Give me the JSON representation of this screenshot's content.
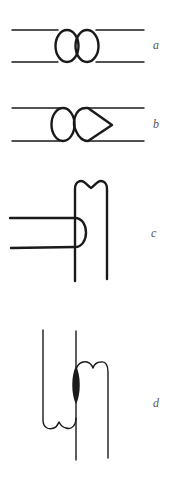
{
  "figures": [
    {
      "id": "a",
      "label": "a",
      "description": "two parallel horizontal lines joined by two adjacent ellipse loops"
    },
    {
      "id": "b",
      "label": "b",
      "description": "two parallel horizontal lines with one ellipse loop and one teardrop loop pointing right"
    },
    {
      "id": "c",
      "label": "c",
      "description": "horizontal U-shaped loop butting against vertical loop with double-bump top"
    },
    {
      "id": "d",
      "label": "d",
      "description": "two interlocking vertical loops with bumped ends joined by a filled spindle"
    }
  ],
  "colors": {
    "stroke": "#1a1a1a",
    "label": "#555555",
    "background": "#ffffff"
  }
}
